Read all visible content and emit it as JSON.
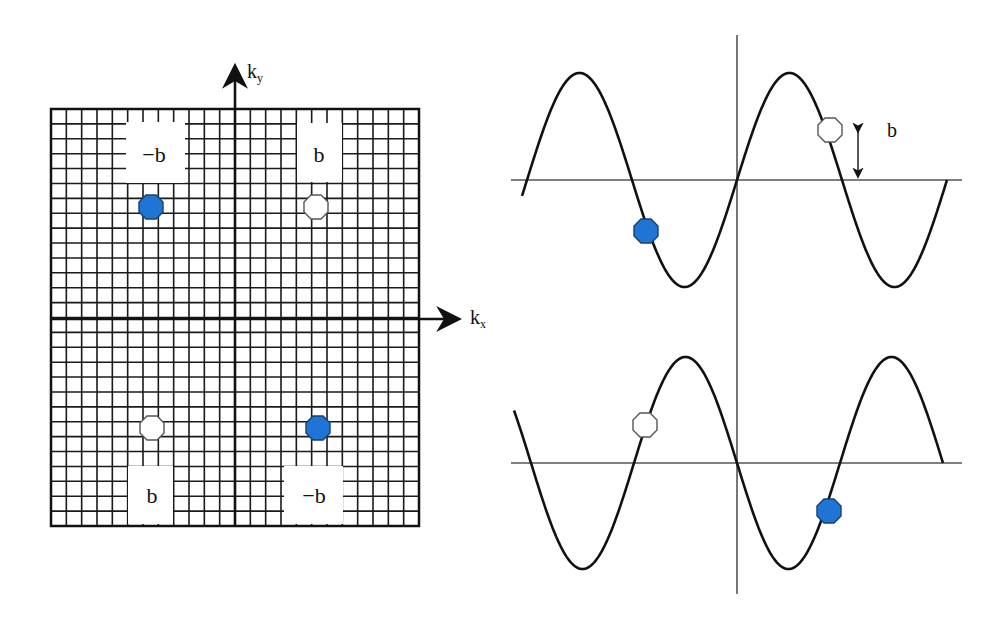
{
  "kspace": {
    "title": "k-space grid",
    "axes": {
      "x_label": "k",
      "x_sub": "x",
      "y_label": "k",
      "y_sub": "y"
    },
    "grid": {
      "left": 51,
      "top": 109,
      "right": 419,
      "bottom": 526,
      "cols": 24,
      "rows": 28,
      "origin_x": 235,
      "origin_y": 319
    },
    "labels": [
      {
        "text": "−b",
        "box": [
          126,
          122,
          59,
          61
        ],
        "tx": 154,
        "ty": 162
      },
      {
        "text": "b",
        "box": [
          297,
          123,
          45,
          59
        ],
        "tx": 319,
        "ty": 162
      },
      {
        "text": "b",
        "box": [
          128,
          466,
          45,
          58
        ],
        "tx": 152,
        "ty": 503
      },
      {
        "text": "−b",
        "box": [
          284,
          466,
          59,
          58
        ],
        "tx": 314,
        "ty": 503
      }
    ],
    "points": [
      {
        "name": "kspace-point-negative-top-left",
        "cx": 151,
        "cy": 207,
        "fill": "blue"
      },
      {
        "name": "kspace-point-positive-top-right",
        "cx": 316,
        "cy": 207,
        "fill": "white"
      },
      {
        "name": "kspace-point-positive-bottom-left",
        "cx": 152,
        "cy": 428,
        "fill": "white"
      },
      {
        "name": "kspace-point-negative-bottom-right",
        "cx": 318,
        "cy": 428,
        "fill": "blue"
      }
    ]
  },
  "waveforms": {
    "vertical_axis": {
      "x": 737,
      "y1": 35,
      "y2": 594
    },
    "top": {
      "baseline_y": 180,
      "line_x1": 511,
      "line_x2": 962,
      "amplitude": 107,
      "half_period": 105,
      "zero_x": 737,
      "sign": 1,
      "x_start": 522,
      "x_end": 947,
      "markers": [
        {
          "name": "top-wave-white-marker",
          "cx": 830,
          "cy": 130,
          "fill": "white"
        },
        {
          "name": "top-wave-blue-marker",
          "cx": 646,
          "cy": 231,
          "fill": "blue"
        }
      ],
      "amplitude_arrow": {
        "x": 858,
        "y1": 127,
        "y2": 180
      },
      "amplitude_label": {
        "text": "b",
        "x": 887,
        "y": 137
      }
    },
    "bottom": {
      "baseline_y": 463,
      "line_x1": 511,
      "line_x2": 962,
      "amplitude": 106,
      "half_period": 103,
      "zero_x": 737,
      "sign": -1,
      "x_start": 514,
      "x_end": 943,
      "markers": [
        {
          "name": "bottom-wave-white-marker",
          "cx": 645,
          "cy": 425,
          "fill": "white"
        },
        {
          "name": "bottom-wave-blue-marker",
          "cx": 829,
          "cy": 511,
          "fill": "blue"
        }
      ]
    }
  },
  "colors": {
    "blue": "#1f74d4",
    "blue_stroke": "#16416f",
    "white": "#ffffff",
    "white_stroke": "#555555",
    "ink": "#111111",
    "axis_line": "#555555"
  }
}
